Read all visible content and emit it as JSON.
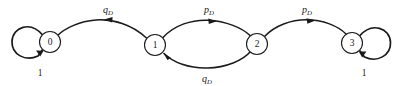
{
  "diagram": {
    "type": "state-transition-diagram",
    "background_color": "#ffffff",
    "stroke_color": "#1a1a1a",
    "node_fill": "#ffffff",
    "nodes": [
      {
        "id": "0",
        "label": "0",
        "cx": 50,
        "cy": 42,
        "r": 10.5
      },
      {
        "id": "1",
        "label": "1",
        "cx": 155,
        "cy": 45,
        "r": 10.5
      },
      {
        "id": "2",
        "label": "2",
        "cx": 257,
        "cy": 44,
        "r": 10.5
      },
      {
        "id": "3",
        "label": "3",
        "cx": 352,
        "cy": 43,
        "r": 10.5
      }
    ],
    "edges": [
      {
        "id": "e-1-0",
        "from": "1",
        "to": "0",
        "label_base": "q",
        "label_sub": "D",
        "label_full": "qD",
        "label_x": 108,
        "label_y": 13,
        "direction": "left",
        "curve": "arc-above"
      },
      {
        "id": "e-1-2",
        "from": "1",
        "to": "2",
        "label_base": "p",
        "label_sub": "D",
        "label_full": "pD",
        "label_x": 209,
        "label_y": 13,
        "direction": "right",
        "curve": "arc-above"
      },
      {
        "id": "e-2-1",
        "from": "2",
        "to": "1",
        "label_base": "q",
        "label_sub": "D",
        "label_full": "qD",
        "label_x": 207,
        "label_y": 82,
        "direction": "left",
        "curve": "arc-below"
      },
      {
        "id": "e-2-3",
        "from": "2",
        "to": "3",
        "label_base": "p",
        "label_sub": "D",
        "label_full": "pD",
        "label_x": 307,
        "label_y": 13,
        "direction": "right",
        "curve": "arc-above"
      }
    ],
    "self_loops": [
      {
        "id": "loop-0",
        "node": "0",
        "label": "1",
        "side": "left",
        "label_x": 40,
        "label_y": 76,
        "cx": 29,
        "cy": 39,
        "r": 18
      },
      {
        "id": "loop-3",
        "node": "3",
        "label": "1",
        "side": "right",
        "label_x": 364,
        "label_y": 76,
        "cx": 372,
        "cy": 41,
        "r": 18
      }
    ]
  }
}
